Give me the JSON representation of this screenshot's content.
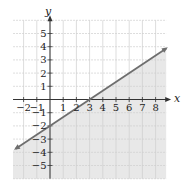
{
  "chart_data": {
    "type": "line",
    "title": "",
    "xlabel": "x",
    "ylabel": "y",
    "xlim": [
      -2.8,
      8.8
    ],
    "ylim": [
      -6,
      6
    ],
    "grid": true,
    "x_ticks": [
      -2,
      -1,
      1,
      2,
      3,
      4,
      5,
      6,
      7,
      8
    ],
    "y_ticks": [
      -5,
      -4,
      -3,
      -2,
      -1,
      1,
      2,
      3,
      4,
      5
    ],
    "x_tick_labels": [
      "−2",
      "−1",
      "1",
      "2",
      "3",
      "4",
      "5",
      "6",
      "7",
      "8"
    ],
    "y_tick_labels": [
      "−5",
      "−4",
      "−3",
      "−2",
      "−1",
      "1",
      "2",
      "3",
      "4",
      "5"
    ],
    "series": [
      {
        "name": "boundary line",
        "equation": "y = (2/3)x − 2",
        "style": "solid",
        "arrows": "both",
        "x": [
          -2.6,
          0,
          3,
          8.8
        ],
        "y": [
          -3.73,
          -2,
          0,
          3.87
        ]
      }
    ],
    "shading": {
      "region": "below line",
      "inequality": "y ≤ (2/3)x − 2",
      "color": "#e6e6e6"
    },
    "legend": null
  },
  "colors": {
    "line": "#6e6e6e",
    "axis": "#333333",
    "grid": "#cfcfcf",
    "shade": "#e8e8e8"
  }
}
